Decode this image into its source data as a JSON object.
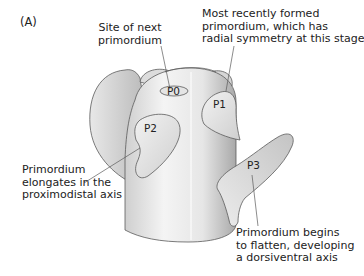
{
  "panel_label": "(A)",
  "primordia": {
    "p0": "P0",
    "p1": "P1",
    "p2": "P2",
    "p3": "P3"
  },
  "annotations": {
    "site_next": {
      "line1": "Site of next",
      "line2": "primordium"
    },
    "most_recent": {
      "line1": "Most recently formed",
      "line2": "primordium, which has",
      "line3": "radial symmetry at this stage"
    },
    "elongates": {
      "line1": "Primordium",
      "line2": "elongates in the",
      "line3": "proximodistal axis"
    },
    "flatten": {
      "line1": "Primordium begins",
      "line2": "to flatten, developing",
      "line3": "a dorsiventral axis"
    }
  },
  "colors": {
    "outline": "#5a5a5a",
    "fill_light": "#f2f2f2",
    "fill_mid": "#d9d9d9",
    "fill_dark": "#bdbdbd",
    "text": "#222222"
  }
}
